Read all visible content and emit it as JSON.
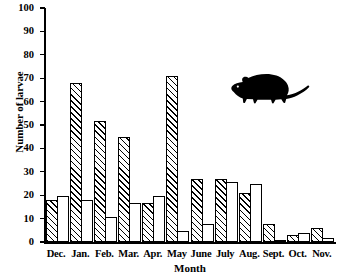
{
  "chart_data": {
    "type": "bar",
    "title": "",
    "subtitle": "",
    "xlabel": "Month",
    "ylabel": "Number of larvae",
    "ylim": [
      0,
      100
    ],
    "yticks": [
      0,
      10,
      20,
      30,
      40,
      50,
      60,
      70,
      80,
      90,
      100
    ],
    "grid": false,
    "legend": "none",
    "categories": [
      "Dec.",
      "Jan.",
      "Feb.",
      "Mar.",
      "Apr.",
      "May",
      "June",
      "July",
      "Aug.",
      "Sept.",
      "Oct.",
      "Nov."
    ],
    "series": [
      {
        "name": "hatched",
        "fill": "diagonal-hatch",
        "values": [
          18,
          68,
          52,
          45,
          17,
          71,
          27,
          27,
          21,
          8,
          3,
          6
        ]
      },
      {
        "name": "white",
        "fill": "solid-white",
        "values": [
          20,
          18,
          11,
          17,
          20,
          5,
          8,
          26,
          25,
          1,
          4,
          2
        ]
      }
    ],
    "annotations": [
      {
        "name": "rodent-silhouette",
        "label": "rat",
        "x_px": 228,
        "y_px": 66
      }
    ],
    "colors": {
      "axis": "#000000",
      "bar_outline": "#000000",
      "hatch": "#000000",
      "background": "#ffffff",
      "silhouette": "#000000"
    }
  }
}
